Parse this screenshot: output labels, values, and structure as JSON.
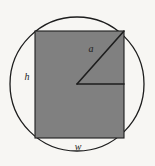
{
  "figure": {
    "kind": "geometry-diagram",
    "background_color": "#f7f6f3",
    "stroke_color": "#1d1d1d",
    "fill_color": "#808080",
    "circle": {
      "name": "circumscribed-circle",
      "center_x": 77,
      "center_y": 84,
      "radius": 67,
      "stroke_width": 1.3,
      "fill": "none"
    },
    "rectangle": {
      "name": "inscribed-rectangle",
      "x": 35,
      "y": 31,
      "width": 89,
      "height": 107,
      "fill": "#808080",
      "stroke_width": 1.1
    },
    "triangle": {
      "name": "radius-right-triangle",
      "vertex_center_x": 77,
      "vertex_center_y": 84,
      "vertex_corner_x": 124,
      "vertex_corner_y": 31,
      "vertex_right_x": 124,
      "vertex_right_y": 84,
      "stroke_width": 1.6
    },
    "labels": {
      "hypotenuse": {
        "text": "a",
        "x": 91,
        "y": 50
      },
      "height": {
        "text": "h",
        "x": 27,
        "y": 78
      },
      "width": {
        "text": "w",
        "x": 78,
        "y": 148
      }
    }
  }
}
